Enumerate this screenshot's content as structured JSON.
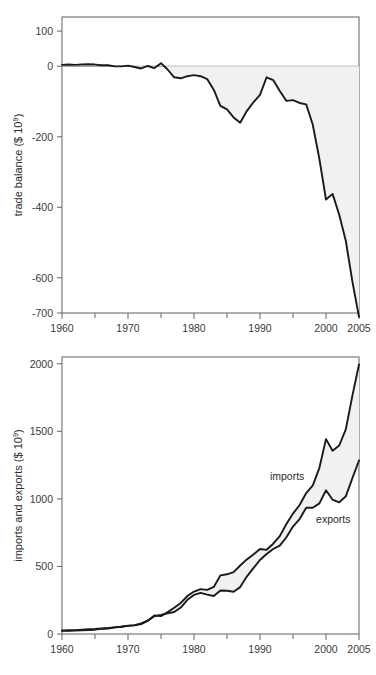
{
  "figure": {
    "background": "#ffffff",
    "line_color": "#1a1a1a",
    "fill_color": "#f1f1f1",
    "axis_color": "#6f6f6f"
  },
  "chart_data": [
    {
      "id": "trade-balance",
      "type": "area",
      "title": "",
      "xlabel": "",
      "ylabel": "trade balance ($ 10⁹)",
      "ylabel_base": "trade balance ($ 10",
      "ylabel_exp": "9",
      "ylabel_tail": ")",
      "xlim": [
        1960,
        2005
      ],
      "ylim": [
        -700,
        140
      ],
      "grid": false,
      "legend": "none",
      "yticks": [
        100,
        0,
        -200,
        -400,
        -600,
        -700
      ],
      "yticklabels": [
        "100",
        "0",
        "-200",
        "-400",
        "-600",
        "-700"
      ],
      "xticks": [
        1960,
        1970,
        1980,
        1990,
        2000,
        2005
      ],
      "xticklabels": [
        "1960",
        "1970",
        "1980",
        "1990",
        "2000",
        "2005"
      ],
      "xminorticks": [
        1965,
        1975,
        1985,
        1995
      ],
      "baseline": 0,
      "series": [
        {
          "name": "trade balance",
          "x": [
            1960,
            1961,
            1962,
            1963,
            1964,
            1965,
            1966,
            1967,
            1968,
            1969,
            1970,
            1971,
            1972,
            1973,
            1974,
            1975,
            1976,
            1977,
            1978,
            1979,
            1980,
            1981,
            1982,
            1983,
            1984,
            1985,
            1986,
            1987,
            1988,
            1989,
            1990,
            1991,
            1992,
            1993,
            1994,
            1995,
            1996,
            1997,
            1998,
            1999,
            2000,
            2001,
            2002,
            2003,
            2004,
            2005
          ],
          "values": [
            4,
            5,
            4,
            5,
            6,
            5,
            3,
            3,
            0,
            0,
            2,
            -2,
            -6,
            1,
            -5,
            9,
            -9,
            -31,
            -34,
            -28,
            -25,
            -28,
            -36,
            -67,
            -112,
            -122,
            -145,
            -160,
            -127,
            -102,
            -81,
            -31,
            -39,
            -70,
            -98,
            -96,
            -104,
            -108,
            -166,
            -263,
            -378,
            -362,
            -421,
            -495,
            -611,
            -711
          ]
        }
      ]
    },
    {
      "id": "imports-exports",
      "type": "line",
      "title": "",
      "xlabel": "",
      "ylabel": "imports and exports ($ 10⁹)",
      "ylabel_base": "imports and exports ($ 10",
      "ylabel_exp": "9",
      "ylabel_tail": ")",
      "xlim": [
        1960,
        2005
      ],
      "ylim": [
        0,
        2050
      ],
      "grid": false,
      "legend": "inline-annotations",
      "yticks": [
        2000,
        1500,
        1000,
        500,
        0
      ],
      "yticklabels": [
        "2000",
        "1500",
        "1000",
        "500",
        "0"
      ],
      "xticks": [
        1960,
        1970,
        1980,
        1990,
        2000,
        2005
      ],
      "xticklabels": [
        "1960",
        "1970",
        "1980",
        "1990",
        "2000",
        "2005"
      ],
      "xminorticks": [
        1965,
        1975,
        1985,
        1995
      ],
      "annotations": [
        {
          "label": "imports",
          "x": 1991.5,
          "y": 1140
        },
        {
          "label": "exports",
          "x": 1998.5,
          "y": 820
        }
      ],
      "series": [
        {
          "name": "imports",
          "x": [
            1960,
            1961,
            1962,
            1963,
            1964,
            1965,
            1966,
            1967,
            1968,
            1969,
            1970,
            1971,
            1972,
            1973,
            1974,
            1975,
            1976,
            1977,
            1978,
            1979,
            1980,
            1981,
            1982,
            1983,
            1984,
            1985,
            1986,
            1987,
            1988,
            1989,
            1990,
            1991,
            1992,
            1993,
            1994,
            1995,
            1996,
            1997,
            1998,
            1999,
            2000,
            2001,
            2002,
            2003,
            2004,
            2005
          ],
          "values": [
            23,
            23,
            25,
            27,
            29,
            32,
            38,
            41,
            49,
            54,
            60,
            66,
            79,
            98,
            137,
            132,
            162,
            194,
            230,
            281,
            314,
            332,
            327,
            348,
            434,
            442,
            458,
            507,
            552,
            589,
            629,
            623,
            668,
            724,
            814,
            891,
            955,
            1043,
            1100,
            1230,
            1442,
            1356,
            1395,
            1514,
            1764,
            1995
          ]
        },
        {
          "name": "exports",
          "x": [
            1960,
            1961,
            1962,
            1963,
            1964,
            1965,
            1966,
            1967,
            1968,
            1969,
            1970,
            1971,
            1972,
            1973,
            1974,
            1975,
            1976,
            1977,
            1978,
            1979,
            1980,
            1981,
            1982,
            1983,
            1984,
            1985,
            1986,
            1987,
            1988,
            1989,
            1990,
            1991,
            1992,
            1993,
            1994,
            1995,
            1996,
            1997,
            1998,
            1999,
            2000,
            2001,
            2002,
            2003,
            2004,
            2005
          ],
          "values": [
            27,
            28,
            29,
            32,
            35,
            37,
            41,
            44,
            49,
            54,
            62,
            64,
            73,
            99,
            132,
            141,
            153,
            163,
            196,
            253,
            289,
            304,
            291,
            281,
            322,
            320,
            313,
            347,
            425,
            487,
            548,
            592,
            629,
            654,
            716,
            795,
            851,
            935,
            934,
            967,
            1064,
            994,
            974,
            1019,
            1153,
            1284
          ]
        }
      ]
    }
  ]
}
